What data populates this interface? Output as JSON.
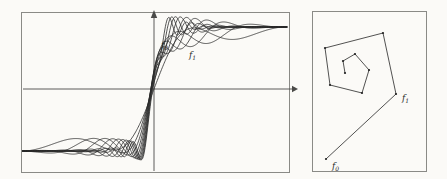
{
  "figure": {
    "background_color": "#fbfaf7",
    "ink_color": "#2b2b2b",
    "frame_color": "#8a8a86"
  },
  "left_panel": {
    "name": "function-family-plot",
    "frame": {
      "x": 0,
      "y": 0,
      "w": 269,
      "h": 161
    },
    "axes": {
      "x_axis_y": 77,
      "y_axis_x": 133,
      "x_arrow_at": 271,
      "y_arrow_at": -2,
      "show_grid": false
    },
    "labels": [
      {
        "id": "f0",
        "base": "f",
        "sub": "0",
        "x": 140,
        "y": 36
      },
      {
        "id": "f1",
        "base": "f",
        "sub": "1",
        "x": 168,
        "y": 46
      }
    ]
  },
  "right_panel": {
    "name": "orbit-spiral-plot",
    "frame": {
      "x": 0,
      "y": 0,
      "w": 115,
      "h": 161
    },
    "orbit": {
      "points": [
        [
          14,
          148
        ],
        [
          84,
          83
        ],
        [
          71,
          22
        ],
        [
          13,
          37
        ],
        [
          18,
          74
        ],
        [
          50,
          82
        ],
        [
          57,
          59
        ],
        [
          43,
          43
        ],
        [
          31,
          50
        ],
        [
          33,
          62
        ]
      ],
      "vertex_radius": 1.1
    },
    "labels": [
      {
        "id": "f0",
        "base": "f",
        "sub": "0",
        "x": 20,
        "y": 158
      },
      {
        "id": "f1",
        "base": "f",
        "sub": "1",
        "x": 90,
        "y": 90
      }
    ]
  },
  "chart_data": {
    "type": "line",
    "title": "",
    "xlabel": "",
    "ylabel": "",
    "series": [
      {
        "name": "f0",
        "frequency": 1.0,
        "amplitude": 1.0,
        "phase": 0.0
      },
      {
        "name": "f1",
        "frequency": 1.45,
        "amplitude": 0.93,
        "phase": 0.3
      },
      {
        "name": "f2",
        "frequency": 1.95,
        "amplitude": 0.87,
        "phase": 0.6
      },
      {
        "name": "f3",
        "frequency": 2.5,
        "amplitude": 0.81,
        "phase": 0.9
      },
      {
        "name": "f4",
        "frequency": 3.1,
        "amplitude": 0.76,
        "phase": 1.2
      },
      {
        "name": "f5",
        "frequency": 3.75,
        "amplitude": 0.71,
        "phase": 1.5
      },
      {
        "name": "f6",
        "frequency": 4.45,
        "amplitude": 0.66,
        "phase": 1.8
      },
      {
        "name": "f7",
        "frequency": 5.2,
        "amplitude": 0.62,
        "phase": 2.1
      },
      {
        "name": "f8",
        "frequency": 6.0,
        "amplitude": 0.58,
        "phase": 2.4
      },
      {
        "name": "f9",
        "frequency": 6.85,
        "amplitude": 0.54,
        "phase": 2.7
      }
    ],
    "xlim": [
      -1,
      1
    ],
    "ylim": [
      -1.25,
      1.25
    ],
    "grid": false,
    "legend": "inline-annotations",
    "annotations": [
      "f0",
      "f1"
    ]
  }
}
